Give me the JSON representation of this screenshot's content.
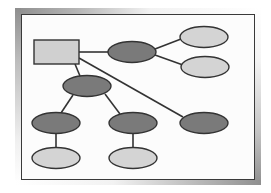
{
  "diagram": {
    "type": "tree",
    "colors": {
      "frame_dark": "#8e8e8e",
      "canvas_border": "#3a3a3a",
      "canvas_bg": "#fcfcfc",
      "edge": "#333333",
      "root_fill": "#d0d0d0",
      "dark_node_fill": "#7a7a7a",
      "light_node_fill": "#d4d4d4",
      "node_stroke": "#333333"
    },
    "nodes": [
      {
        "id": "root",
        "shape": "rect",
        "fill": "light",
        "x": 34,
        "y": 40,
        "w": 45,
        "h": 24,
        "label": ""
      },
      {
        "id": "n1",
        "shape": "ellipse",
        "fill": "dark",
        "cx": 132,
        "cy": 52,
        "rx": 24,
        "ry": 10.5,
        "label": ""
      },
      {
        "id": "n1a",
        "shape": "ellipse",
        "fill": "light",
        "cx": 204,
        "cy": 37,
        "rx": 24,
        "ry": 10.5,
        "label": ""
      },
      {
        "id": "n1b",
        "shape": "ellipse",
        "fill": "light",
        "cx": 205,
        "cy": 67,
        "rx": 24,
        "ry": 10.5,
        "label": ""
      },
      {
        "id": "n2",
        "shape": "ellipse",
        "fill": "dark",
        "cx": 87,
        "cy": 86,
        "rx": 24,
        "ry": 10.5,
        "label": ""
      },
      {
        "id": "n2a",
        "shape": "ellipse",
        "fill": "dark",
        "cx": 56,
        "cy": 123,
        "rx": 24,
        "ry": 10.5,
        "label": ""
      },
      {
        "id": "n2b",
        "shape": "ellipse",
        "fill": "dark",
        "cx": 133,
        "cy": 123,
        "rx": 24,
        "ry": 10.5,
        "label": ""
      },
      {
        "id": "n2a1",
        "shape": "ellipse",
        "fill": "light",
        "cx": 56,
        "cy": 158,
        "rx": 24,
        "ry": 10.5,
        "label": ""
      },
      {
        "id": "n2b1",
        "shape": "ellipse",
        "fill": "light",
        "cx": 133,
        "cy": 158,
        "rx": 24,
        "ry": 10.5,
        "label": ""
      },
      {
        "id": "n3",
        "shape": "ellipse",
        "fill": "dark",
        "cx": 204,
        "cy": 123,
        "rx": 24,
        "ry": 10.5,
        "label": ""
      }
    ],
    "edges": [
      {
        "from": "root",
        "to": "n1",
        "x1": 79,
        "y1": 52,
        "x2": 108,
        "y2": 52
      },
      {
        "from": "n1",
        "to": "n1a",
        "x1": 155,
        "y1": 49,
        "x2": 181,
        "y2": 39
      },
      {
        "from": "n1",
        "to": "n1b",
        "x1": 155,
        "y1": 55,
        "x2": 183,
        "y2": 65
      },
      {
        "from": "root",
        "to": "n2",
        "x1": 75,
        "y1": 64,
        "x2": 80,
        "y2": 76
      },
      {
        "from": "root",
        "to": "n3",
        "x1": 79,
        "y1": 58,
        "x2": 183,
        "y2": 117
      },
      {
        "from": "n2",
        "to": "n2a",
        "x1": 73,
        "y1": 95,
        "x2": 61,
        "y2": 113
      },
      {
        "from": "n2",
        "to": "n2b",
        "x1": 105,
        "y1": 94,
        "x2": 120,
        "y2": 114
      },
      {
        "from": "n2a",
        "to": "n2a1",
        "x1": 56,
        "y1": 133,
        "x2": 56,
        "y2": 148
      },
      {
        "from": "n2b",
        "to": "n2b1",
        "x1": 133,
        "y1": 133,
        "x2": 133,
        "y2": 148
      }
    ]
  }
}
